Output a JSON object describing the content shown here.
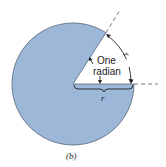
{
  "figure": {
    "caption": "(b)",
    "angle_label_line1": "One",
    "angle_label_line2": "radian",
    "arc_label": "r",
    "radius_label": "r",
    "colors": {
      "disk_fill": "#9db7d8",
      "disk_stroke": "#55667a",
      "line": "#333333",
      "background": "#ffffff"
    },
    "geometry": {
      "center": [
        73,
        84
      ],
      "radius": 61,
      "wedge_angle_rad": 1
    }
  }
}
